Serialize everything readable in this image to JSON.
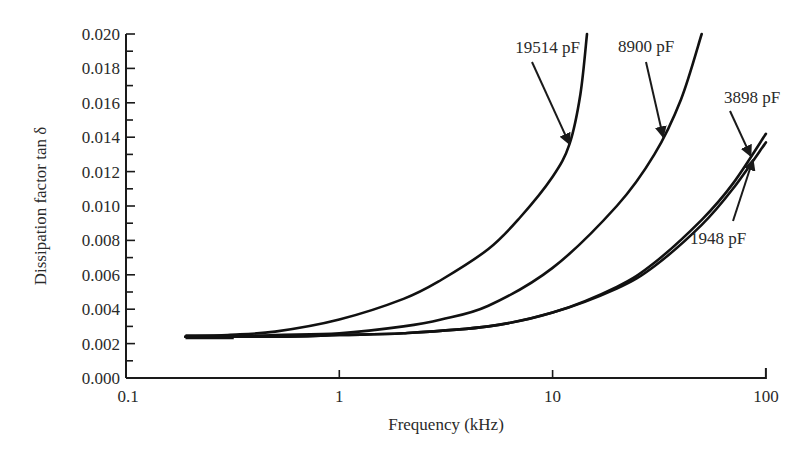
{
  "chart_data": {
    "type": "line",
    "title": "",
    "xlabel": "Frequency (kHz)",
    "ylabel": "Dissipation factor tan δ",
    "xscale": "log",
    "xlim": [
      0.1,
      100
    ],
    "ylim": [
      0.0,
      0.02
    ],
    "grid": false,
    "legend": "inline annotations with arrows",
    "x_ticks": [
      "0.1",
      "1",
      "10",
      "100"
    ],
    "y_ticks": [
      "0.000",
      "0.002",
      "0.004",
      "0.006",
      "0.008",
      "0.010",
      "0.012",
      "0.014",
      "0.016",
      "0.018",
      "0.020"
    ],
    "series": [
      {
        "name": "19514 pF",
        "x": [
          0.19,
          0.3,
          0.5,
          1,
          2,
          3,
          5,
          7,
          10,
          12,
          13.5,
          14.5
        ],
        "values": [
          0.0024,
          0.0025,
          0.0027,
          0.0034,
          0.0046,
          0.0057,
          0.0075,
          0.0093,
          0.0117,
          0.0136,
          0.0165,
          0.02
        ]
      },
      {
        "name": "8900 pF",
        "x": [
          0.19,
          0.3,
          0.5,
          1,
          2,
          3,
          5,
          10,
          20,
          30,
          40,
          50
        ],
        "values": [
          0.0024,
          0.0024,
          0.0025,
          0.0026,
          0.003,
          0.0034,
          0.0042,
          0.0064,
          0.01,
          0.013,
          0.0162,
          0.02
        ]
      },
      {
        "name": "3898 pF",
        "x": [
          0.19,
          0.5,
          1,
          2,
          5,
          10,
          20,
          30,
          50,
          70,
          100
        ],
        "values": [
          0.0024,
          0.0024,
          0.0025,
          0.0026,
          0.003,
          0.0038,
          0.0053,
          0.0067,
          0.0092,
          0.0113,
          0.0142
        ]
      },
      {
        "name": "1948 pF",
        "x": [
          0.19,
          0.5,
          1,
          2,
          5,
          10,
          20,
          30,
          50,
          70,
          100
        ],
        "values": [
          0.0024,
          0.0024,
          0.0025,
          0.0026,
          0.003,
          0.0038,
          0.0052,
          0.0065,
          0.0089,
          0.011,
          0.0137
        ]
      }
    ],
    "annotations": [
      {
        "text": "19514 pF",
        "points_to_x": 12,
        "points_to_y": 0.0136
      },
      {
        "text": "8900 pF",
        "points_to_x": 33,
        "points_to_y": 0.014
      },
      {
        "text": "3898 pF",
        "points_to_x": 85,
        "points_to_y": 0.0129
      },
      {
        "text": "1948 pF",
        "points_to_x": 87,
        "points_to_y": 0.0127
      }
    ]
  }
}
